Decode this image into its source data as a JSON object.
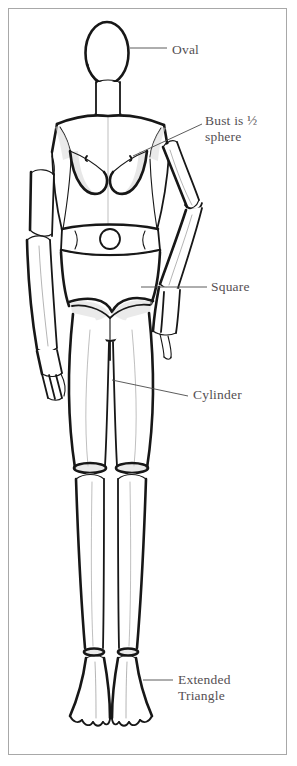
{
  "figure": {
    "background_color": "#ffffff",
    "frame_color": "#a8a8a8",
    "ink_color": "#1a1a1a",
    "label_color": "#555053",
    "leader_color": "#4a4a4a"
  },
  "labels": {
    "oval": "Oval",
    "bust": "Bust is ½\nsphere",
    "square": "Square",
    "cylinder": "Cylinder",
    "triangle": "Extended\nTriangle"
  },
  "annotations": [
    {
      "name": "oval",
      "text": "Oval",
      "target": "head",
      "leader_from": [
        128,
        48
      ],
      "leader_to": [
        166,
        48
      ]
    },
    {
      "name": "bust",
      "text": "Bust is ½ sphere",
      "target": "bust",
      "leader_from": [
        133,
        155
      ],
      "leader_to": [
        201,
        124
      ]
    },
    {
      "name": "square",
      "text": "Square",
      "target": "pelvis",
      "leader_from": [
        140,
        287
      ],
      "leader_to": [
        206,
        287
      ]
    },
    {
      "name": "cylinder",
      "text": "Cylinder",
      "target": "thigh",
      "leader_from": [
        112,
        380
      ],
      "leader_to": [
        188,
        396
      ]
    },
    {
      "name": "triangle",
      "text": "Extended Triangle",
      "target": "foot",
      "leader_from": [
        142,
        679
      ],
      "leader_to": [
        172,
        679
      ]
    }
  ],
  "body_parts": [
    {
      "name": "head",
      "shape": "oval"
    },
    {
      "name": "neck",
      "shape": "cylinder"
    },
    {
      "name": "torso",
      "shape": "tapered-box"
    },
    {
      "name": "bust",
      "shape": "half-sphere"
    },
    {
      "name": "waistband",
      "shape": "band"
    },
    {
      "name": "navel",
      "shape": "circle"
    },
    {
      "name": "pelvis",
      "shape": "square"
    },
    {
      "name": "upper-arm-left",
      "shape": "cylinder"
    },
    {
      "name": "forearm-left",
      "shape": "cylinder"
    },
    {
      "name": "hand-left",
      "shape": "block"
    },
    {
      "name": "upper-arm-right",
      "shape": "cylinder"
    },
    {
      "name": "forearm-right",
      "shape": "cylinder"
    },
    {
      "name": "hand-right",
      "shape": "block"
    },
    {
      "name": "thigh-left",
      "shape": "cylinder"
    },
    {
      "name": "thigh-right",
      "shape": "cylinder"
    },
    {
      "name": "knee-left",
      "shape": "ellipse"
    },
    {
      "name": "knee-right",
      "shape": "ellipse"
    },
    {
      "name": "calf-left",
      "shape": "cylinder"
    },
    {
      "name": "calf-right",
      "shape": "cylinder"
    },
    {
      "name": "foot-left",
      "shape": "extended-triangle"
    },
    {
      "name": "foot-right",
      "shape": "extended-triangle"
    }
  ]
}
